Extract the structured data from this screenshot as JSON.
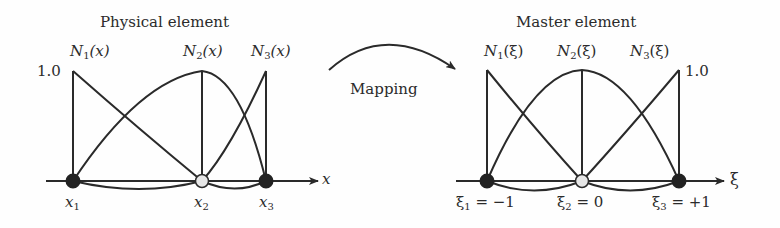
{
  "physical": {
    "title": "Physical element",
    "value_label": "1.0",
    "axis_label": "x",
    "shape_functions": [
      {
        "name": "N",
        "sub": "1",
        "arg": "(x)"
      },
      {
        "name": "N",
        "sub": "2",
        "arg": "(x)"
      },
      {
        "name": "N",
        "sub": "3",
        "arg": "(x)"
      }
    ],
    "nodes": [
      {
        "sym": "x",
        "sub": "1",
        "rest": ""
      },
      {
        "sym": "x",
        "sub": "2",
        "rest": ""
      },
      {
        "sym": "x",
        "sub": "3",
        "rest": ""
      }
    ]
  },
  "mapping": {
    "label": "Mapping"
  },
  "master": {
    "title": "Master element",
    "value_label": "1.0",
    "axis_label": "ξ",
    "shape_functions": [
      {
        "name": "N",
        "sub": "1",
        "arg": "(ξ)"
      },
      {
        "name": "N",
        "sub": "2",
        "arg": "(ξ)"
      },
      {
        "name": "N",
        "sub": "3",
        "arg": "(ξ)"
      }
    ],
    "nodes": [
      {
        "sym": "ξ",
        "sub": "1",
        "rest": " = −1"
      },
      {
        "sym": "ξ",
        "sub": "2",
        "rest": " = 0"
      },
      {
        "sym": "ξ",
        "sub": "3",
        "rest": " = +1"
      }
    ]
  },
  "colors": {
    "line": "#2a2a2a",
    "end_node": "#222222",
    "mid_node": "#e6e6e6"
  }
}
